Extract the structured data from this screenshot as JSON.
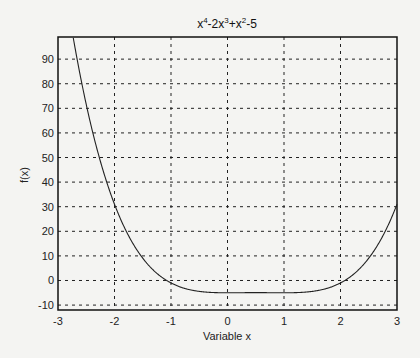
{
  "chart_data": {
    "type": "line",
    "title_parts": {
      "base": "x",
      "p1": "4",
      "mid1": "-2x",
      "p2": "3",
      "mid2": "+x",
      "p3": "2",
      "tail": "-5"
    },
    "xlabel": "Variable x",
    "ylabel": "f(x)",
    "xlim": [
      -3,
      3
    ],
    "ylim": [
      -12,
      99
    ],
    "xticks": [
      -3,
      -2,
      -1,
      0,
      1,
      2,
      3
    ],
    "yticks": [
      -10,
      0,
      10,
      20,
      30,
      40,
      50,
      60,
      70,
      80,
      90
    ],
    "grid": true,
    "function": "x^4-2x^3+x^2-5",
    "series": [
      {
        "name": "f(x)",
        "x": [
          -3,
          -2.75,
          -2.5,
          -2.25,
          -2,
          -1.75,
          -1.5,
          -1.25,
          -1,
          -0.75,
          -0.5,
          -0.25,
          0,
          0.25,
          0.5,
          0.75,
          1,
          1.25,
          1.5,
          1.75,
          2,
          2.25,
          2.5,
          2.75,
          3
        ],
        "values": [
          139,
          107.67,
          80.94,
          58.44,
          31,
          18.39,
          9.06,
          2.91,
          -1,
          -3.27,
          -4.44,
          -4.91,
          -5,
          -4.96,
          -4.94,
          -4.96,
          -5,
          -4.91,
          -4.44,
          -3.27,
          -1,
          2.91,
          9.06,
          18.39,
          31
        ]
      }
    ]
  }
}
